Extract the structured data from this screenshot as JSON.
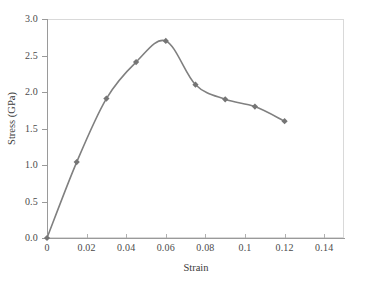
{
  "chart_data": {
    "type": "line",
    "title": "",
    "xlabel": "Strain",
    "ylabel": "Stress (GPa)",
    "xlim": [
      0,
      0.15
    ],
    "ylim": [
      0,
      3.0
    ],
    "grid": false,
    "legend": null,
    "xticks": [
      0,
      0.02,
      0.04,
      0.06,
      0.08,
      0.1,
      0.12,
      0.14
    ],
    "xticklabels": [
      "0",
      "0.02",
      "0.04",
      "0.06",
      "0.08",
      "0.1",
      "0.12",
      "0.14"
    ],
    "yticks": [
      0.0,
      0.5,
      1.0,
      1.5,
      2.0,
      2.5,
      3.0
    ],
    "yticklabels": [
      "0.0",
      "0.5",
      "1.0",
      "1.5",
      "2.0",
      "2.5",
      "3.0"
    ],
    "series": [
      {
        "name": "stress-strain",
        "marker": "diamond",
        "color": "#808080",
        "x": [
          0,
          0.015,
          0.03,
          0.045,
          0.06,
          0.075,
          0.09,
          0.105,
          0.12
        ],
        "y": [
          0.0,
          1.04,
          1.91,
          2.41,
          2.7,
          2.1,
          1.9,
          1.8,
          1.6
        ]
      }
    ]
  },
  "style": {
    "line_color": "#808080",
    "marker_color": "#757575",
    "axis_color": "#9a9a9a",
    "frame_color": "#d9d9d9",
    "text_color": "#3a3a3a",
    "background": "#ffffff"
  }
}
